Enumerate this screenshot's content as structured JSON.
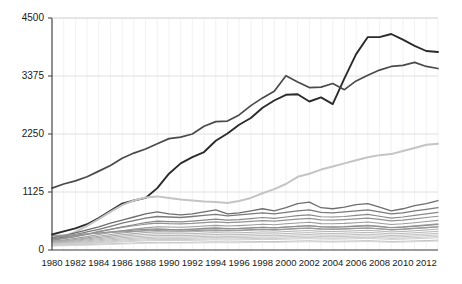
{
  "chart_data": {
    "type": "line",
    "title": "",
    "subtitle": "",
    "xlabel": "",
    "ylabel": "",
    "xlim": [
      1980,
      2013
    ],
    "ylim": [
      0,
      4500
    ],
    "grid": true,
    "legend_position": "none",
    "yticks": [
      0,
      1125,
      2250,
      3375,
      4500
    ],
    "ytick_labels": [
      "0",
      "1125",
      "2250",
      "3375",
      "4500"
    ],
    "xticks": [
      1980,
      1982,
      1984,
      1986,
      1988,
      1990,
      1992,
      1994,
      1996,
      1998,
      2000,
      2002,
      2004,
      2006,
      2008,
      2010,
      2012
    ],
    "xtick_labels": [
      "1980",
      "1982",
      "1984",
      "1986",
      "1988",
      "1990",
      "1992",
      "1994",
      "1996",
      "1998",
      "2000",
      "2002",
      "2004",
      "2006",
      "2008",
      "2010",
      "2012"
    ],
    "x": [
      1980,
      1981,
      1982,
      1983,
      1984,
      1985,
      1986,
      1987,
      1988,
      1989,
      1990,
      1991,
      1992,
      1993,
      1994,
      1995,
      1996,
      1997,
      1998,
      1999,
      2000,
      2001,
      2002,
      2003,
      2004,
      2005,
      2006,
      2007,
      2008,
      2009,
      2010,
      2011,
      2012,
      2013
    ],
    "series": [
      {
        "name": "series-01-dark-steep",
        "color": "#2b2b2b",
        "width": 1.9,
        "values": [
          300,
          360,
          420,
          500,
          620,
          760,
          900,
          960,
          1010,
          1200,
          1480,
          1680,
          1800,
          1900,
          2120,
          2260,
          2430,
          2560,
          2760,
          2900,
          3010,
          3020,
          2880,
          2960,
          2830,
          3330,
          3800,
          4130,
          4130,
          4190,
          4080,
          3960,
          3860,
          3840
        ],
        "label_hint": "steepest rising line peaking near 4190 around 2009"
      },
      {
        "name": "series-02-dark-early-high",
        "color": "#4a4a4a",
        "width": 1.7,
        "values": [
          1200,
          1280,
          1340,
          1420,
          1530,
          1640,
          1780,
          1880,
          1960,
          2060,
          2160,
          2190,
          2250,
          2400,
          2490,
          2500,
          2620,
          2800,
          2950,
          3080,
          3380,
          3260,
          3150,
          3160,
          3230,
          3110,
          3280,
          3390,
          3490,
          3560,
          3580,
          3640,
          3560,
          3520
        ],
        "label_hint": "line starting near 1200 in 1980, ends near 3520"
      },
      {
        "name": "series-03-light-riser",
        "color": "#c4c4c4",
        "width": 2.0,
        "values": [
          180,
          260,
          350,
          470,
          600,
          740,
          870,
          960,
          1020,
          1040,
          1010,
          980,
          960,
          940,
          930,
          910,
          950,
          1010,
          1100,
          1180,
          1280,
          1420,
          1480,
          1560,
          1620,
          1680,
          1740,
          1800,
          1840,
          1860,
          1920,
          1980,
          2040,
          2060
        ],
        "label_hint": "light grey line rising to about 2050"
      },
      {
        "name": "series-04-mid-grey",
        "color": "#6e6e6e",
        "width": 1.3,
        "values": [
          230,
          280,
          330,
          390,
          450,
          520,
          580,
          640,
          700,
          740,
          700,
          680,
          700,
          740,
          780,
          700,
          720,
          760,
          800,
          760,
          820,
          900,
          930,
          820,
          800,
          830,
          880,
          900,
          830,
          760,
          800,
          860,
          900,
          960
        ],
        "label_hint": "mid grey band line"
      },
      {
        "name": "series-05-mid-grey-b",
        "color": "#7a7a7a",
        "width": 1.3,
        "values": [
          210,
          250,
          300,
          350,
          400,
          460,
          520,
          570,
          620,
          650,
          640,
          630,
          650,
          670,
          690,
          660,
          680,
          700,
          720,
          700,
          730,
          760,
          780,
          730,
          720,
          740,
          760,
          780,
          740,
          700,
          720,
          760,
          790,
          820
        ],
        "label_hint": "mid grey band line"
      },
      {
        "name": "series-06-grey",
        "color": "#8a8a8a",
        "width": 1.2,
        "values": [
          190,
          220,
          260,
          300,
          350,
          400,
          450,
          490,
          530,
          560,
          550,
          545,
          560,
          580,
          600,
          580,
          590,
          610,
          630,
          615,
          640,
          665,
          680,
          645,
          640,
          650,
          670,
          690,
          655,
          620,
          640,
          670,
          700,
          730
        ],
        "label_hint": "grey band line"
      },
      {
        "name": "series-07-grey",
        "color": "#939393",
        "width": 1.2,
        "values": [
          200,
          230,
          270,
          310,
          360,
          400,
          440,
          470,
          500,
          520,
          510,
          505,
          515,
          530,
          545,
          530,
          540,
          555,
          570,
          560,
          580,
          600,
          615,
          585,
          580,
          590,
          605,
          620,
          595,
          565,
          580,
          605,
          630,
          655
        ],
        "label_hint": "grey band line"
      },
      {
        "name": "series-08-grey",
        "color": "#9c9c9c",
        "width": 1.1,
        "values": [
          170,
          195,
          225,
          260,
          300,
          340,
          375,
          405,
          430,
          450,
          445,
          440,
          450,
          465,
          478,
          465,
          473,
          485,
          500,
          490,
          508,
          525,
          538,
          512,
          508,
          516,
          530,
          543,
          520,
          495,
          508,
          530,
          552,
          575
        ],
        "label_hint": "grey band line"
      },
      {
        "name": "series-09-grey",
        "color": "#a4a4a4",
        "width": 1.1,
        "values": [
          160,
          180,
          205,
          235,
          268,
          300,
          330,
          355,
          378,
          395,
          392,
          390,
          398,
          410,
          422,
          412,
          418,
          428,
          440,
          432,
          447,
          462,
          473,
          452,
          448,
          455,
          467,
          478,
          458,
          437,
          448,
          467,
          487,
          507
        ],
        "label_hint": "grey band line"
      },
      {
        "name": "series-10-grey",
        "color": "#ababab",
        "width": 1.1,
        "values": [
          150,
          168,
          190,
          215,
          243,
          270,
          296,
          318,
          338,
          352,
          350,
          348,
          355,
          365,
          376,
          368,
          373,
          382,
          392,
          386,
          398,
          412,
          421,
          404,
          400,
          406,
          416,
          426,
          409,
          390,
          400,
          416,
          434,
          452
        ],
        "label_hint": "grey band line"
      },
      {
        "name": "series-11-grey",
        "color": "#b2b2b2",
        "width": 1.0,
        "values": [
          140,
          155,
          174,
          196,
          220,
          244,
          266,
          286,
          303,
          316,
          314,
          312,
          318,
          327,
          337,
          330,
          334,
          342,
          351,
          346,
          357,
          369,
          377,
          362,
          358,
          364,
          373,
          382,
          367,
          350,
          359,
          373,
          389,
          405
        ],
        "label_hint": "grey band line"
      },
      {
        "name": "series-12-grey",
        "color": "#b8b8b8",
        "width": 1.0,
        "values": [
          130,
          143,
          159,
          178,
          199,
          220,
          239,
          256,
          271,
          283,
          281,
          279,
          285,
          293,
          301,
          295,
          299,
          306,
          314,
          310,
          319,
          330,
          337,
          324,
          320,
          326,
          334,
          342,
          329,
          313,
          321,
          334,
          348,
          362
        ],
        "label_hint": "grey band line"
      },
      {
        "name": "series-13-grey",
        "color": "#bfbfbf",
        "width": 1.0,
        "values": [
          120,
          131,
          145,
          161,
          179,
          197,
          214,
          229,
          242,
          253,
          251,
          250,
          255,
          262,
          269,
          264,
          267,
          274,
          281,
          277,
          285,
          295,
          301,
          290,
          286,
          291,
          299,
          306,
          294,
          280,
          287,
          299,
          311,
          324
        ],
        "label_hint": "grey band line"
      },
      {
        "name": "series-14-grey",
        "color": "#c5c5c5",
        "width": 1.0,
        "values": [
          110,
          120,
          132,
          146,
          162,
          178,
          193,
          206,
          218,
          227,
          226,
          225,
          229,
          236,
          242,
          237,
          240,
          246,
          252,
          249,
          256,
          265,
          271,
          261,
          257,
          262,
          269,
          275,
          264,
          252,
          258,
          269,
          280,
          291
        ],
        "label_hint": "grey band line"
      },
      {
        "name": "series-15-grey",
        "color": "#cbcbcb",
        "width": 1.0,
        "values": [
          100,
          109,
          120,
          132,
          146,
          160,
          173,
          185,
          196,
          204,
          203,
          202,
          206,
          212,
          217,
          213,
          216,
          221,
          226,
          224,
          230,
          238,
          243,
          234,
          231,
          235,
          241,
          247,
          237,
          226,
          232,
          241,
          251,
          261
        ],
        "label_hint": "grey band line"
      },
      {
        "name": "series-16-grey",
        "color": "#d0d0d0",
        "width": 1.0,
        "values": [
          92,
          100,
          110,
          121,
          133,
          146,
          158,
          168,
          178,
          185,
          184,
          184,
          187,
          192,
          197,
          193,
          196,
          201,
          205,
          203,
          209,
          216,
          221,
          213,
          210,
          214,
          219,
          224,
          215,
          205,
          210,
          219,
          228,
          237
        ],
        "label_hint": "grey band line"
      },
      {
        "name": "series-17-grey",
        "color": "#8f8f8f",
        "width": 1.2,
        "values": [
          250,
          270,
          290,
          310,
          330,
          350,
          370,
          385,
          400,
          410,
          400,
          395,
          405,
          420,
          430,
          415,
          420,
          430,
          440,
          430,
          445,
          460,
          470,
          450,
          445,
          450,
          460,
          470,
          452,
          432,
          443,
          460,
          478,
          495
        ],
        "label_hint": "grey band line"
      },
      {
        "name": "series-18-grey-flat",
        "color": "#989898",
        "width": 1.2,
        "values": [
          280,
          290,
          300,
          312,
          325,
          340,
          352,
          362,
          372,
          378,
          372,
          368,
          374,
          384,
          392,
          382,
          386,
          394,
          402,
          395,
          406,
          418,
          426,
          410,
          406,
          411,
          419,
          427,
          412,
          395,
          404,
          418,
          433,
          448
        ],
        "label_hint": "grey flat band line"
      },
      {
        "name": "series-19-grey-low",
        "color": "#c0c0c0",
        "width": 1.0,
        "values": [
          85,
          90,
          96,
          103,
          111,
          120,
          128,
          136,
          143,
          148,
          147,
          147,
          150,
          154,
          158,
          155,
          157,
          161,
          165,
          163,
          168,
          174,
          178,
          171,
          169,
          172,
          176,
          181,
          173,
          165,
          169,
          176,
          183,
          191
        ],
        "label_hint": "lowest grey line"
      },
      {
        "name": "series-20-grey-low",
        "color": "#d5d5d5",
        "width": 1.0,
        "values": [
          78,
          83,
          88,
          94,
          101,
          109,
          116,
          123,
          129,
          134,
          133,
          133,
          136,
          139,
          143,
          140,
          142,
          146,
          149,
          147,
          152,
          157,
          161,
          155,
          153,
          156,
          160,
          164,
          157,
          150,
          153,
          160,
          166,
          173
        ],
        "label_hint": "lowest grey line"
      }
    ]
  },
  "layout": {
    "plot_left": 52,
    "plot_right": 438,
    "plot_top": 18,
    "plot_bottom": 250
  }
}
